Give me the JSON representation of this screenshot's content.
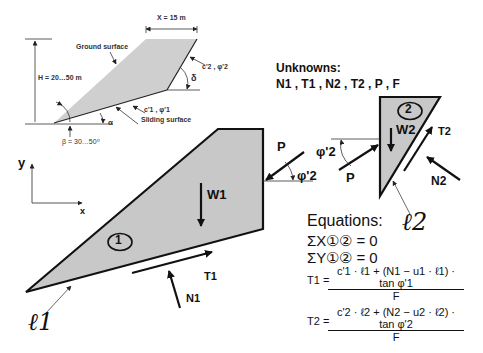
{
  "overview": {
    "x_dim": "X = 15 m",
    "ground_surface": "Ground surface",
    "height": "H = 20…50 m",
    "param2": "c'2 , φ'2",
    "delta": "δ",
    "param1": "c'1 , φ'1",
    "alpha": "α",
    "sliding_surface": "Sliding surface",
    "beta": "β = 30…50⁰"
  },
  "unknowns": {
    "title": "Unknowns:",
    "list": "N1 , T1 , N2 , T2 , P , F"
  },
  "axes": {
    "x": "x",
    "y": "y"
  },
  "block1": {
    "id": "1",
    "weight": "W1",
    "shear": "T1",
    "normal": "N1",
    "length": "ℓ1",
    "force": "P",
    "angle": "φ'2"
  },
  "block2": {
    "id": "2",
    "weight": "W2",
    "shear": "T2",
    "normal": "N2",
    "length": "ℓ2",
    "force": "P",
    "angle": "φ'2"
  },
  "equations": {
    "title": "Equations:",
    "sum_x": "ΣX①② = 0",
    "sum_y": "ΣY①② = 0",
    "t1_lhs": "T1 =",
    "t1_num": "c'1 · ℓ1 + (N1 − u1 · ℓ1) · tan φ'1",
    "t1_den": "F",
    "t2_lhs": "T2 =",
    "t2_num": "c'2 · ℓ2 + (N2 − u2 · ℓ2) · tan φ'2",
    "t2_den": "F"
  },
  "colors": {
    "fill": "#c8c8c8",
    "stroke": "#111111"
  }
}
